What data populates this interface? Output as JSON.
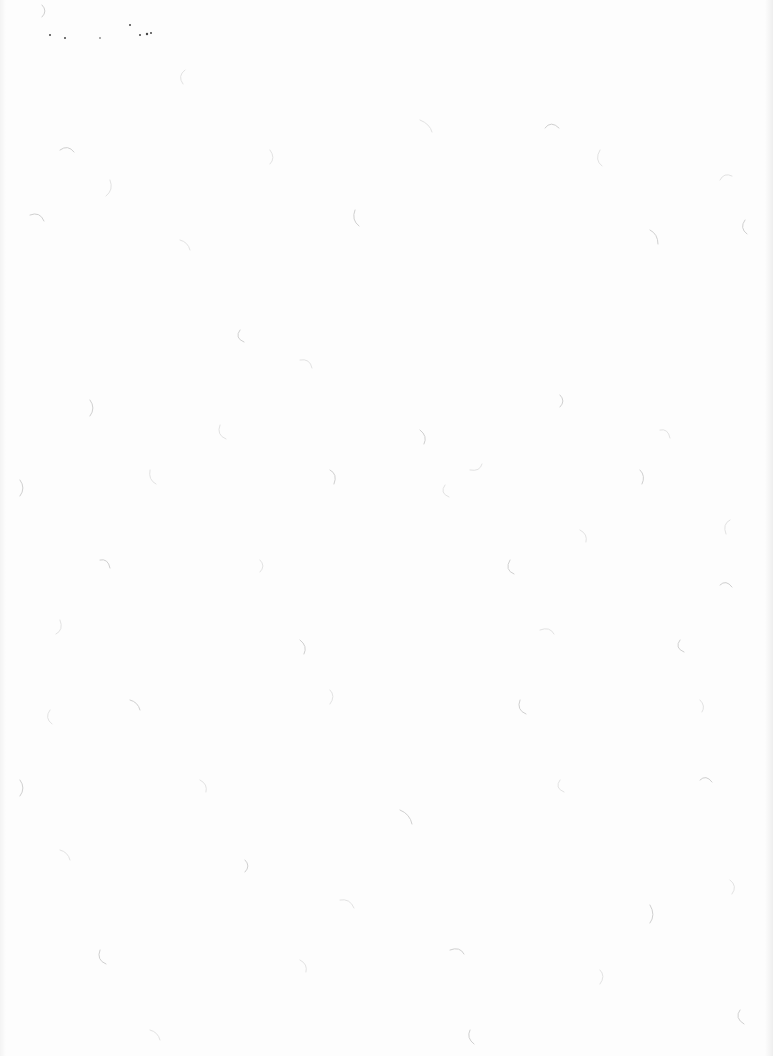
{
  "document": {
    "type": "blank scanned page",
    "background_color": "#fdfdfd",
    "fiber_color": "#cfcfcf",
    "text": ""
  }
}
